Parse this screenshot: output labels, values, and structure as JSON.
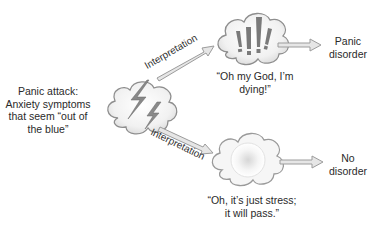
{
  "trigger": {
    "lines": [
      "Panic attack:",
      "Anxiety symptoms",
      "that seem “out of",
      "the blue”"
    ],
    "icon": "storm-cloud-lightning-icon"
  },
  "paths": [
    {
      "arrow_label": "Interpretation",
      "icon": "exclamation-cloud-icon",
      "thought_lines": [
        "“Oh my God, I’m",
        "dying!”"
      ],
      "outcome_lines": [
        "Panic",
        "disorder"
      ]
    },
    {
      "arrow_label": "Interpretation",
      "icon": "calm-cloud-icon",
      "thought_lines": [
        "“Oh, it’s just stress;",
        "it will pass.”"
      ],
      "outcome_lines": [
        "No",
        "disorder"
      ]
    }
  ],
  "colors": {
    "cloud_fill": "#efefef",
    "cloud_stroke": "#9a9a9a",
    "arrow_fill": "#e6e6e6",
    "arrow_stroke": "#9c9c9c",
    "glyph": "#7a7a7a"
  }
}
